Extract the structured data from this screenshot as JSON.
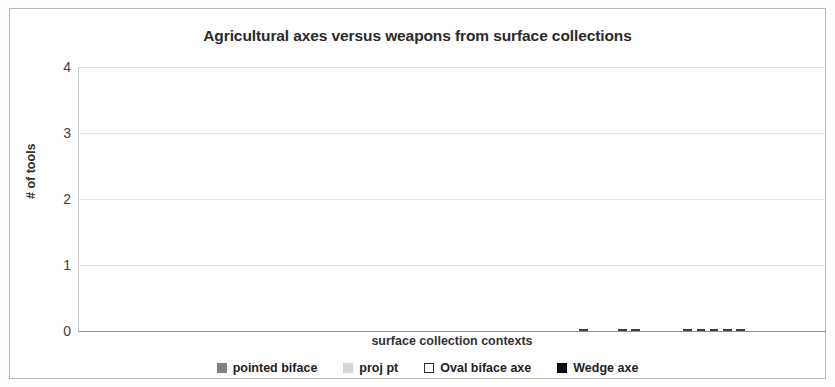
{
  "chart_data": {
    "type": "bar",
    "subtype": "stacked",
    "title": "Agricultural axes versus weapons from surface collections",
    "xlabel": "surface collection contexts",
    "ylabel": "# of tools",
    "ylim": [
      0,
      4
    ],
    "yticks": [
      "0",
      "1",
      "2",
      "3",
      "4"
    ],
    "grid": true,
    "legend_position": "bottom",
    "categories_labeled": false,
    "n_categories": 52,
    "series": [
      {
        "name": "pointed biface",
        "color": "#7f7f7f",
        "values": [
          1,
          1,
          1,
          1,
          1,
          1,
          1,
          1,
          1,
          1,
          1,
          1,
          1,
          1,
          1,
          1,
          1,
          1,
          1,
          1,
          1,
          1,
          1,
          1,
          1,
          2,
          0,
          0,
          0,
          0,
          0,
          0,
          0,
          0,
          0,
          0,
          1,
          1,
          0,
          1,
          1,
          1,
          0,
          1,
          0,
          0,
          0,
          0,
          0,
          0,
          0,
          0
        ]
      },
      {
        "name": "proj pt",
        "color": "#d4d4d4",
        "values": [
          1,
          1,
          1,
          2,
          2,
          3,
          0,
          0,
          0,
          0,
          0,
          0,
          0,
          0,
          0,
          0,
          0,
          0,
          0,
          0,
          0,
          0,
          0,
          0,
          0,
          0,
          1,
          1,
          1,
          1,
          1,
          1,
          1,
          1,
          2,
          2,
          1,
          1,
          2,
          1,
          1,
          1,
          2,
          1,
          2,
          2,
          0,
          0,
          0,
          0,
          0,
          0
        ]
      },
      {
        "name": "Oval biface axe",
        "color": "#ffffff",
        "values": [
          0,
          0,
          0,
          0,
          0,
          0,
          0,
          0,
          0,
          0,
          0,
          0,
          0,
          0,
          0,
          0,
          0,
          0,
          0,
          0,
          0,
          0,
          0,
          0,
          0,
          0,
          0,
          0,
          0,
          0,
          0,
          0,
          0,
          0,
          0,
          0,
          0,
          0,
          1,
          0,
          0,
          1,
          1,
          0,
          0,
          0,
          1,
          1,
          1,
          1,
          1,
          0
        ]
      },
      {
        "name": "Wedge axe",
        "color": "#0d0d0d",
        "values": [
          0,
          0,
          0,
          0,
          0,
          0,
          0,
          0,
          0,
          0,
          0,
          0,
          0,
          0,
          0,
          0,
          0,
          0,
          0,
          0,
          0,
          0,
          0,
          0,
          0,
          0,
          0,
          0,
          0,
          0,
          0,
          0,
          0,
          0,
          0,
          0,
          1,
          1,
          0,
          2,
          3,
          0,
          0,
          1,
          0,
          0,
          0,
          0,
          0,
          0,
          0,
          1
        ]
      }
    ],
    "legend": [
      {
        "label": "pointed biface",
        "swatch": "pointed"
      },
      {
        "label": "proj pt",
        "swatch": "proj"
      },
      {
        "label": "Oval biface axe",
        "swatch": "oval"
      },
      {
        "label": "Wedge axe",
        "swatch": "wedge"
      }
    ],
    "bars": [
      [
        {
          "s": "pointed",
          "v": 1
        },
        {
          "s": "proj",
          "v": 1
        }
      ],
      [
        {
          "s": "pointed",
          "v": 1
        },
        {
          "s": "proj",
          "v": 1
        }
      ],
      [
        {
          "s": "pointed",
          "v": 1
        },
        {
          "s": "proj",
          "v": 1
        }
      ],
      [
        {
          "s": "pointed",
          "v": 1
        },
        {
          "s": "proj",
          "v": 2
        }
      ],
      [
        {
          "s": "pointed",
          "v": 1
        },
        {
          "s": "proj",
          "v": 2
        }
      ],
      [
        {
          "s": "pointed",
          "v": 1
        },
        {
          "s": "proj",
          "v": 3
        }
      ],
      [
        {
          "s": "pointed",
          "v": 1
        }
      ],
      [
        {
          "s": "pointed",
          "v": 1
        }
      ],
      [
        {
          "s": "pointed",
          "v": 1
        }
      ],
      [
        {
          "s": "pointed",
          "v": 1
        }
      ],
      [
        {
          "s": "pointed",
          "v": 1
        }
      ],
      [
        {
          "s": "pointed",
          "v": 1
        }
      ],
      [
        {
          "s": "pointed",
          "v": 1
        }
      ],
      [
        {
          "s": "pointed",
          "v": 1
        }
      ],
      [
        {
          "s": "pointed",
          "v": 1
        }
      ],
      [
        {
          "s": "pointed",
          "v": 1
        }
      ],
      [
        {
          "s": "pointed",
          "v": 1
        }
      ],
      [
        {
          "s": "pointed",
          "v": 1
        }
      ],
      [
        {
          "s": "pointed",
          "v": 1
        }
      ],
      [
        {
          "s": "pointed",
          "v": 1
        }
      ],
      [
        {
          "s": "pointed",
          "v": 1
        }
      ],
      [
        {
          "s": "pointed",
          "v": 1
        }
      ],
      [
        {
          "s": "pointed",
          "v": 1
        }
      ],
      [
        {
          "s": "pointed",
          "v": 1
        }
      ],
      [
        {
          "s": "pointed",
          "v": 1
        }
      ],
      [
        {
          "s": "pointed",
          "v": 2
        }
      ],
      [
        {
          "s": "proj",
          "v": 1
        }
      ],
      [
        {
          "s": "proj",
          "v": 1
        }
      ],
      [
        {
          "s": "proj",
          "v": 1
        }
      ],
      [
        {
          "s": "proj",
          "v": 1
        }
      ],
      [
        {
          "s": "proj",
          "v": 1
        }
      ],
      [
        {
          "s": "proj",
          "v": 1
        }
      ],
      [
        {
          "s": "proj",
          "v": 1
        }
      ],
      [
        {
          "s": "proj",
          "v": 1
        }
      ],
      [
        {
          "s": "proj",
          "v": 2
        }
      ],
      [
        {
          "s": "proj",
          "v": 2
        }
      ],
      [
        {
          "s": "proj",
          "v": 1
        },
        {
          "s": "wedge",
          "v": 1
        }
      ],
      [
        {
          "s": "proj",
          "v": 1
        },
        {
          "s": "wedge",
          "v": 1
        }
      ],
      [
        {
          "s": "proj",
          "v": 2
        },
        {
          "s": "oval",
          "v": 1
        }
      ],
      [
        {
          "s": "pointed",
          "v": 1
        },
        {
          "s": "proj",
          "v": 1
        },
        {
          "s": "wedge",
          "v": 2
        }
      ],
      [
        {
          "s": "pointed",
          "v": 1
        },
        {
          "s": "proj",
          "v": 1
        },
        {
          "s": "wedge",
          "v": 3
        }
      ],
      [
        {
          "s": "pointed",
          "v": 1
        },
        {
          "s": "proj",
          "v": 1
        },
        {
          "s": "oval",
          "v": 1
        }
      ],
      [
        {
          "s": "proj",
          "v": 2
        },
        {
          "s": "oval",
          "v": 1
        }
      ],
      [
        {
          "s": "pointed",
          "v": 1
        },
        {
          "s": "proj",
          "v": 1
        },
        {
          "s": "wedge",
          "v": 1
        }
      ],
      [
        {
          "s": "proj",
          "v": 2
        }
      ],
      [
        {
          "s": "proj",
          "v": 2
        }
      ],
      [
        {
          "s": "oval",
          "v": 1
        }
      ],
      [
        {
          "s": "oval",
          "v": 1
        }
      ],
      [
        {
          "s": "oval",
          "v": 1
        }
      ],
      [
        {
          "s": "oval",
          "v": 1
        }
      ],
      [
        {
          "s": "oval",
          "v": 1
        }
      ],
      [
        {
          "s": "wedge",
          "v": 1
        }
      ],
      [
        {
          "s": "wedge",
          "v": 1
        }
      ],
      [
        {
          "s": "wedge",
          "v": 1
        }
      ],
      [
        {
          "s": "wedge",
          "v": 1
        }
      ],
      [
        {
          "s": "wedge",
          "v": 1
        }
      ],
      [
        {
          "s": "wedge",
          "v": 1
        }
      ]
    ]
  }
}
